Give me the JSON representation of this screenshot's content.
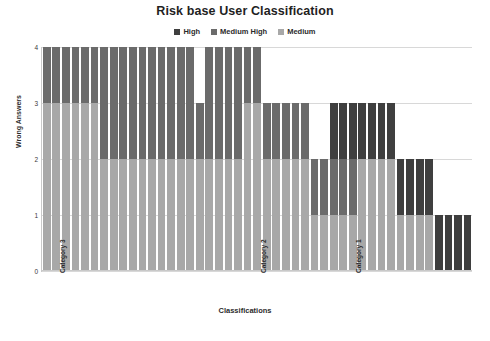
{
  "chart_data": {
    "type": "bar",
    "subtype": "stacked-column",
    "title": "Risk base User Classification",
    "xlabel": "Classifications",
    "ylabel": "Wrong Answers",
    "ylim": [
      0,
      4
    ],
    "yticks": [
      0,
      1,
      2,
      3,
      4
    ],
    "grid": true,
    "legend_position": "top-center",
    "series": [
      {
        "name": "High",
        "color": "#3f3f3f",
        "values": [
          0,
          0,
          0,
          0,
          0,
          0,
          0,
          0,
          0,
          0,
          0,
          0,
          0,
          0,
          0,
          0,
          0,
          0,
          0,
          0,
          0,
          0,
          0,
          0,
          0,
          0,
          0,
          0,
          0,
          0,
          1,
          1,
          1,
          1,
          1,
          1,
          1,
          1,
          1,
          1,
          1,
          1,
          1,
          1,
          1
        ]
      },
      {
        "name": "Medium High",
        "color": "#6b6b6b",
        "values": [
          1,
          1,
          1,
          1,
          1,
          1,
          2,
          2,
          2,
          2,
          2,
          2,
          2,
          2,
          2,
          2,
          1,
          2,
          2,
          2,
          2,
          1,
          1,
          1,
          1,
          1,
          1,
          1,
          1,
          1,
          1,
          1,
          1,
          0,
          0,
          0,
          0,
          0,
          0,
          0,
          0,
          0,
          0,
          0,
          0
        ]
      },
      {
        "name": "Medium",
        "color": "#a8a8a8",
        "values": [
          3,
          3,
          3,
          3,
          3,
          3,
          2,
          2,
          2,
          2,
          2,
          2,
          2,
          2,
          2,
          2,
          2,
          2,
          2,
          2,
          2,
          3,
          3,
          2,
          2,
          2,
          2,
          2,
          1,
          1,
          1,
          1,
          1,
          2,
          2,
          2,
          2,
          1,
          1,
          1,
          1,
          0,
          0,
          0,
          0
        ]
      }
    ],
    "categories": [
      "",
      "",
      "",
      "",
      "",
      "",
      "",
      "",
      "",
      "",
      "",
      "",
      "",
      "",
      "",
      "",
      "",
      "",
      "",
      "",
      "",
      "",
      "",
      "",
      "",
      "",
      "",
      "",
      "",
      "",
      "",
      "",
      "",
      "",
      "",
      "",
      "",
      "",
      "",
      "",
      "",
      "",
      "",
      "",
      ""
    ],
    "labeled_ticks": [
      {
        "index": 1,
        "label": "Category 3"
      },
      {
        "index": 22,
        "label": "Category 2"
      },
      {
        "index": 32,
        "label": "Category 1"
      }
    ]
  },
  "legend": {
    "items": [
      {
        "label": "High",
        "color": "#3f3f3f"
      },
      {
        "label": "Medium High",
        "color": "#6b6b6b"
      },
      {
        "label": "Medium",
        "color": "#a8a8a8"
      }
    ]
  }
}
